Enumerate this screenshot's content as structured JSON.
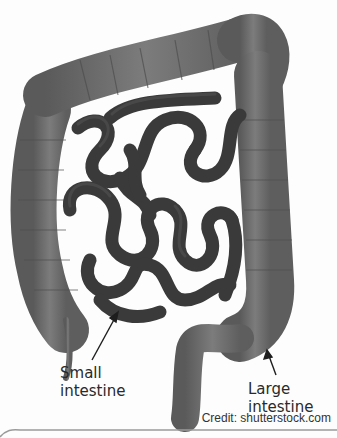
{
  "labels": {
    "small_intestine_line1": "Small",
    "small_intestine_line2": "intestine",
    "large_intestine_line1": "Large",
    "large_intestine_line2": "intestine"
  },
  "credit": "Credit: shutterstock.com",
  "colors": {
    "background": "#fdfdfd",
    "large_intestine": "#6e6e6e",
    "small_intestine": "#3c3c3c",
    "text": "#2a2a2a"
  }
}
